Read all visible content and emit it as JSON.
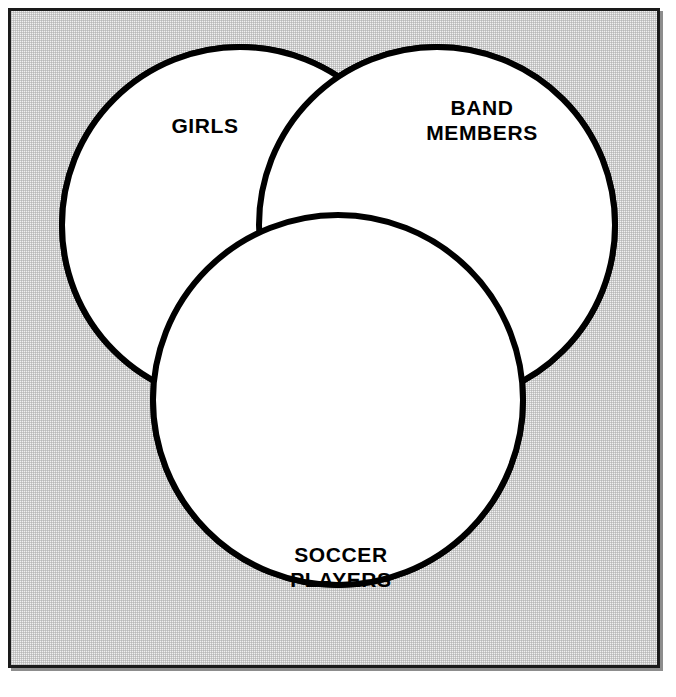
{
  "diagram": {
    "type": "venn",
    "sets": [
      {
        "id": "girls",
        "label": "GIRLS",
        "label_lines": [
          "GIRLS"
        ],
        "cx": 240,
        "cy": 225,
        "r": 178
      },
      {
        "id": "band",
        "label": "BAND MEMBERS",
        "label_lines": [
          "BAND",
          "MEMBERS"
        ],
        "cx": 437,
        "cy": 225,
        "r": 178
      },
      {
        "id": "soccer",
        "label": "SOCCER PLAYERS",
        "label_lines": [
          "SOCCER",
          "PLAYERS"
        ],
        "cx": 338,
        "cy": 400,
        "r": 185
      }
    ],
    "regions": [
      {
        "id": "girls-only",
        "name": "HANNA",
        "sets": [
          "girls"
        ],
        "x": 205,
        "y": 172
      },
      {
        "id": "girls-band",
        "name": "YOLANDA",
        "sets": [
          "girls",
          "band"
        ],
        "x": 339,
        "y": 172
      },
      {
        "id": "band-only",
        "name": "LORENZO",
        "sets": [
          "band"
        ],
        "x": 481,
        "y": 172
      },
      {
        "id": "all-three",
        "name": "ANITA",
        "sets": [
          "girls",
          "band",
          "soccer"
        ],
        "x": 338,
        "y": 316
      },
      {
        "id": "girls-soccer",
        "name": "JESSICA",
        "sets": [
          "girls",
          "soccer"
        ],
        "x": 232,
        "y": 394
      },
      {
        "id": "band-soccer",
        "name": "JUSTO",
        "sets": [
          "band",
          "soccer"
        ],
        "x": 440,
        "y": 394
      },
      {
        "id": "soccer-only",
        "name": "MARCO",
        "sets": [
          "soccer"
        ],
        "x": 338,
        "y": 505
      }
    ],
    "colors": {
      "stroke": "#000000",
      "circle_fill": "#ffffff",
      "background": "#f1f1f1",
      "frame_border": "#1a1a1a",
      "title_text": "#000000",
      "member_text": "#fbfbfb"
    }
  },
  "titles": {
    "girls_line1": "GIRLS",
    "band_line1": "BAND",
    "band_line2": "MEMBERS",
    "soccer_line1": "SOCCER",
    "soccer_line2": "PLAYERS"
  },
  "members": {
    "girls_only": "HANNA",
    "girls_band": "YOLANDA",
    "band_only": "LORENZO",
    "all_three": "ANITA",
    "girls_soccer": "JESSICA",
    "band_soccer": "JUSTO",
    "soccer_only": "MARCO"
  }
}
